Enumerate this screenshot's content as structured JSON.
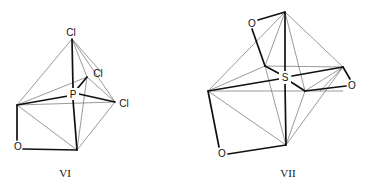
{
  "figure": {
    "structures": [
      {
        "id": "VI",
        "label": "VI",
        "central_atom": "P",
        "atoms": {
          "cl_top": "Cl",
          "cl_back": "Cl",
          "cl_right": "Cl",
          "oxygen": "O"
        }
      },
      {
        "id": "VII",
        "label": "VII",
        "central_atom": "S",
        "atoms": {
          "o_top": "O",
          "o_right": "O",
          "o_bottom": "O"
        }
      }
    ]
  }
}
